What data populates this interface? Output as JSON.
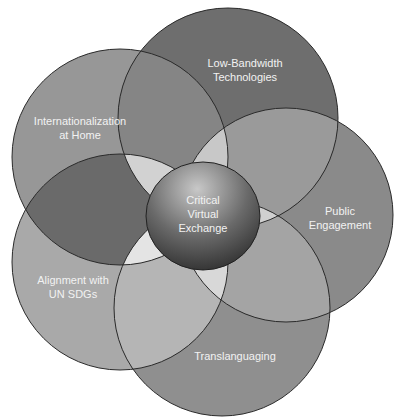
{
  "diagram": {
    "type": "overlapping-circles",
    "center": {
      "label_lines": [
        "Critical",
        "Virtual",
        "Exchange"
      ],
      "cx": 203,
      "cy": 216,
      "rx": 57,
      "ry": 54
    },
    "petals": [
      {
        "id": "low-bandwidth",
        "label_lines": [
          "Low-Bandwidth",
          "Technologies"
        ],
        "cx": 228,
        "cy": 118,
        "r": 110,
        "color": "#6e6e6e",
        "label_x": 245,
        "label_y": 70
      },
      {
        "id": "public-engagement",
        "label_lines": [
          "Public",
          "Engagement"
        ],
        "cx": 286,
        "cy": 215,
        "r": 107,
        "color": "#8a8a8a",
        "label_x": 340,
        "label_y": 218
      },
      {
        "id": "translanguaging",
        "label_lines": [
          "Translanguaging"
        ],
        "cx": 222,
        "cy": 308,
        "r": 108,
        "color": "#8f8f8f",
        "label_x": 235,
        "label_y": 356
      },
      {
        "id": "alignment-sdgs",
        "label_lines": [
          "Alignment with",
          "UN SDGs"
        ],
        "cx": 120,
        "cy": 262,
        "r": 108,
        "color": "#a9a9a9",
        "label_x": 73,
        "label_y": 287
      },
      {
        "id": "internationalization",
        "label_lines": [
          "Internationalization",
          "at Home"
        ],
        "cx": 120,
        "cy": 157,
        "r": 108,
        "color": "#979797",
        "label_x": 80,
        "label_y": 128
      }
    ]
  }
}
